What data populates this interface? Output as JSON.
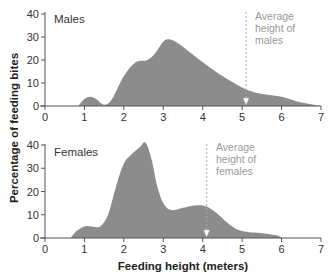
{
  "chart_data": [
    {
      "type": "area",
      "title": "Males",
      "xlabel": "Feeding height (meters)",
      "ylabel": "Percentage of feeding bites",
      "xlim": [
        0,
        7
      ],
      "ylim": [
        0,
        40
      ],
      "x_ticks": [
        "0",
        "1",
        "2",
        "3",
        "4",
        "5",
        "6",
        "7"
      ],
      "y_ticks": [
        "0",
        "10",
        "20",
        "30",
        "40"
      ],
      "grid": false,
      "x": [
        0.85,
        1.0,
        1.15,
        1.3,
        1.5,
        1.7,
        2.0,
        2.3,
        2.6,
        2.8,
        3.0,
        3.15,
        3.4,
        3.7,
        4.0,
        4.5,
        5.0,
        5.3,
        5.6,
        6.0,
        6.5,
        7.0
      ],
      "values": [
        0,
        3,
        4,
        3,
        0.5,
        3,
        13,
        19,
        20,
        23,
        28,
        29,
        27,
        23,
        19,
        13,
        8,
        6,
        5,
        4,
        1.5,
        0
      ],
      "annotation": {
        "text": "Average height of males",
        "x": 5.1
      }
    },
    {
      "type": "area",
      "title": "Females",
      "xlabel": "Feeding height (meters)",
      "ylabel": "Percentage of feeding bites",
      "xlim": [
        0,
        7
      ],
      "ylim": [
        0,
        40
      ],
      "x_ticks": [
        "0",
        "1",
        "2",
        "3",
        "4",
        "5",
        "6",
        "7"
      ],
      "y_ticks": [
        "0",
        "10",
        "20",
        "30",
        "40"
      ],
      "grid": false,
      "x": [
        0.65,
        0.8,
        1.0,
        1.2,
        1.4,
        1.6,
        1.8,
        2.0,
        2.2,
        2.4,
        2.55,
        2.7,
        2.85,
        3.0,
        3.2,
        3.5,
        3.8,
        4.1,
        4.4,
        4.7,
        5.0,
        5.5,
        5.9,
        6.0
      ],
      "values": [
        0,
        3,
        5,
        5,
        5,
        10,
        22,
        32,
        36,
        39,
        41,
        34,
        22,
        15,
        12,
        13,
        14,
        13.5,
        10,
        5.5,
        3,
        2,
        1,
        0
      ],
      "annotation": {
        "text": "Average height of females",
        "x": 4.1
      }
    }
  ],
  "labels": {
    "males_panel": "Males",
    "females_panel": "Females",
    "y_axis_title": "Percentage of feeding bites",
    "x_axis_title": "Feeding height (meters)",
    "male_avg_lines": [
      "Average",
      "height of",
      "males"
    ],
    "female_avg_lines": [
      "Average",
      "height of",
      "females"
    ]
  },
  "colors": {
    "fill": "#8c8c8c",
    "axis": "#555555",
    "annotation": "#a0a0a0"
  }
}
